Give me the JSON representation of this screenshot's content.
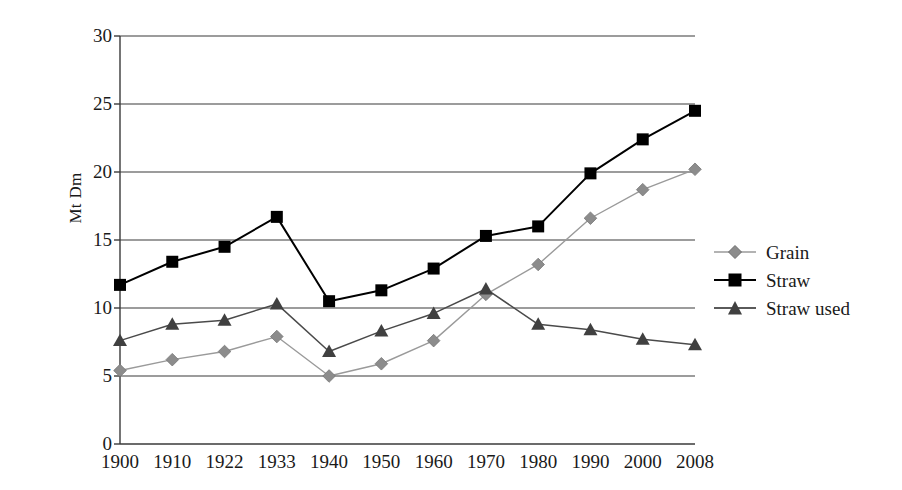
{
  "chart_data": {
    "type": "line",
    "title": "",
    "xlabel": "",
    "ylabel": "Mt Dm",
    "categories": [
      "1900",
      "1910",
      "1922",
      "1933",
      "1940",
      "1950",
      "1960",
      "1970",
      "1980",
      "1990",
      "2000",
      "2008"
    ],
    "ylim": [
      0,
      30
    ],
    "yticks": [
      0,
      5,
      10,
      15,
      20,
      25,
      30
    ],
    "grid": "horizontal",
    "legend_position": "right",
    "series": [
      {
        "name": "Grain",
        "marker": "diamond",
        "color": "#8c8c8c",
        "values": [
          5.4,
          6.2,
          6.8,
          7.9,
          5.0,
          5.9,
          7.6,
          11.0,
          13.2,
          16.6,
          18.7,
          20.2
        ]
      },
      {
        "name": "Straw",
        "marker": "square",
        "color": "#000000",
        "values": [
          11.7,
          13.4,
          14.5,
          16.7,
          10.5,
          11.3,
          12.9,
          15.3,
          16.0,
          19.9,
          22.4,
          24.5
        ]
      },
      {
        "name": "Straw used",
        "marker": "triangle",
        "color": "#404040",
        "values": [
          7.6,
          8.8,
          9.1,
          10.3,
          6.8,
          8.3,
          9.6,
          11.4,
          8.8,
          8.4,
          7.7,
          7.3
        ]
      }
    ]
  },
  "axis": {
    "y_tick_labels": [
      "30",
      "25",
      "20",
      "15",
      "10",
      "5",
      "0"
    ],
    "y_title": "Mt Dm"
  },
  "legend": {
    "items": [
      {
        "label": "Grain"
      },
      {
        "label": "Straw"
      },
      {
        "label": "Straw used"
      }
    ]
  }
}
